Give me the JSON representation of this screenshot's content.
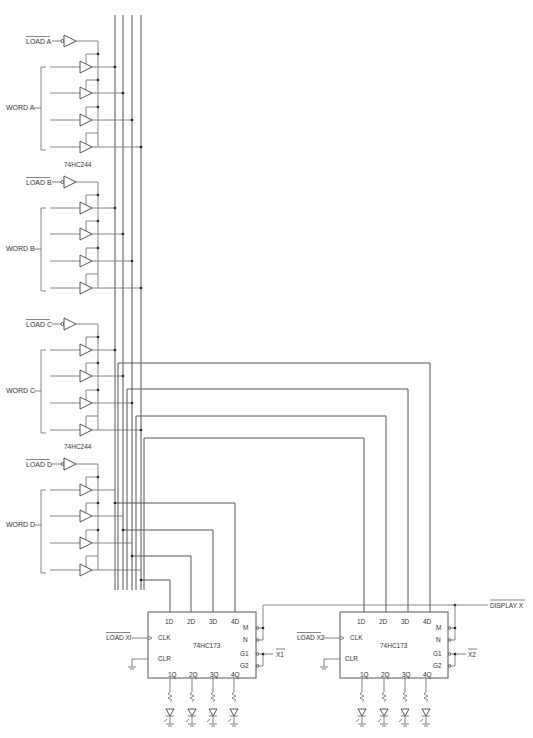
{
  "diagram": {
    "type": "circuit-schematic",
    "buffer_chip": "74HC244",
    "register_chip": "74HC173",
    "words": [
      {
        "id": "A",
        "label": "WORD A",
        "load_label": "LOAD A",
        "chip_label": "74HC244",
        "y": 40
      },
      {
        "id": "B",
        "label": "WORD B",
        "load_label": "LOAD B",
        "chip_label": "",
        "y": 181
      },
      {
        "id": "C",
        "label": "WORD C",
        "load_label": "LOAD C",
        "chip_label": "74HC244",
        "y": 323
      },
      {
        "id": "D",
        "label": "WORD D",
        "load_label": "LOAD D",
        "chip_label": "",
        "y": 463
      }
    ],
    "registers": [
      {
        "id": "X1",
        "chip_label": "74HC173",
        "clk_input_label": "LOAD XI",
        "output_enable_label": "X1",
        "inputs": [
          "1D",
          "2D",
          "3D",
          "4D"
        ],
        "outputs": [
          "1Q",
          "2Q",
          "3Q",
          "4Q"
        ],
        "left_pins": [
          "CLK",
          "CLR"
        ],
        "right_pins": [
          "M",
          "N",
          "G1",
          "G2"
        ]
      },
      {
        "id": "X2",
        "chip_label": "74HC173",
        "clk_input_label": "LOAD X2",
        "output_enable_label": "X2",
        "inputs": [
          "1D",
          "2D",
          "3D",
          "4D"
        ],
        "outputs": [
          "1Q",
          "2Q",
          "3Q",
          "4Q"
        ],
        "left_pins": [
          "CLK",
          "CLR"
        ],
        "right_pins": [
          "M",
          "N",
          "G1",
          "G2"
        ]
      }
    ],
    "display_label": "DISPLAY X"
  }
}
